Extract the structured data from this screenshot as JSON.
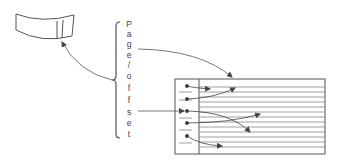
{
  "diagram": {
    "label_letters": [
      "P",
      "a",
      "g",
      "e",
      "/",
      "o",
      "f",
      "f",
      "s",
      "e",
      "t"
    ],
    "label_text": "Page/offset",
    "elements": {
      "disk": "disk-segment-icon",
      "table": "page-table",
      "brace": "bracket"
    },
    "stroke_color": "#555555"
  }
}
